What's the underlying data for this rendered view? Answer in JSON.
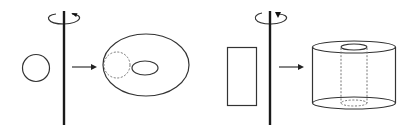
{
  "diagram": {
    "description": "Solids of revolution: a circle rotated about an axis forms a torus; a rectangle rotated about an axis forms a hollow cylinder",
    "colors": {
      "stroke": "#333333",
      "axis": "#1a1a1a",
      "dashed": "#777777",
      "background": "#ffffff"
    },
    "panels": [
      {
        "id": "left",
        "axis_label": "rotation-axis",
        "input_shape": "circle",
        "output_shape": "torus",
        "rotation_direction": "counterclockwise-arrow"
      },
      {
        "id": "right",
        "axis_label": "rotation-axis",
        "input_shape": "rectangle",
        "output_shape": "hollow-cylinder",
        "rotation_direction": "counterclockwise-arrow"
      }
    ]
  }
}
